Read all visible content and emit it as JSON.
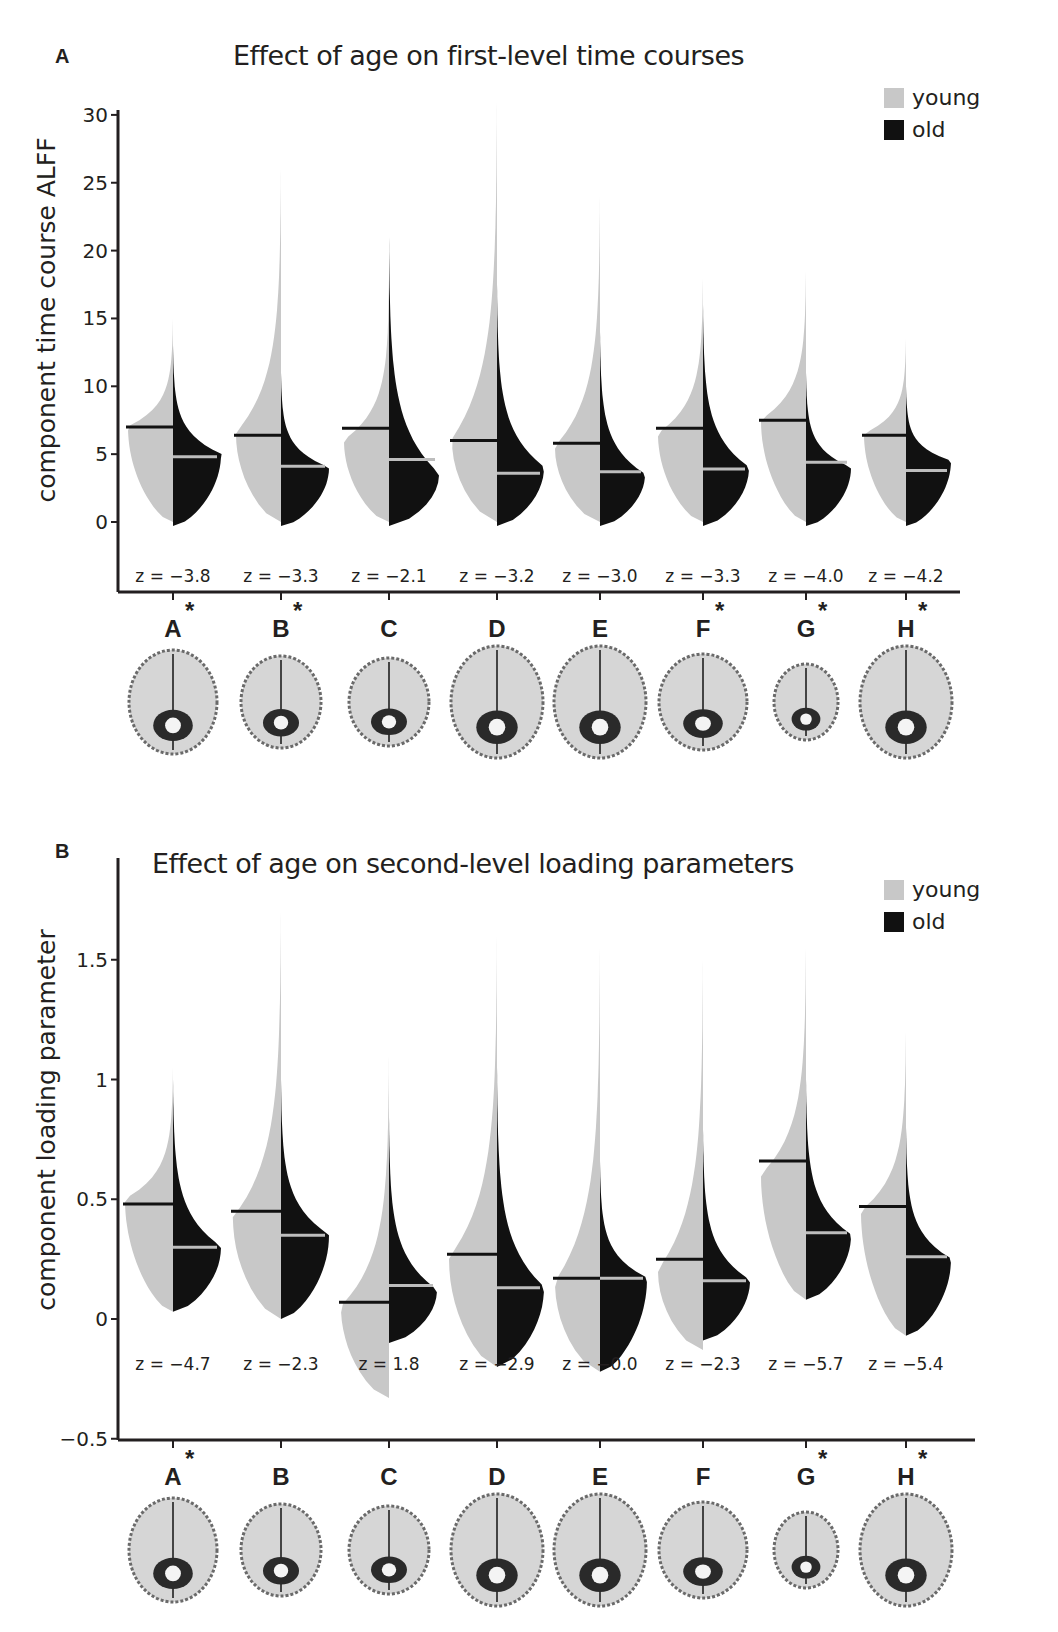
{
  "panels": {
    "A": {
      "letter": "A",
      "title": "Effect of age on first-level time courses",
      "ylabel": "component time course  ALFF",
      "legend": [
        {
          "label": "young",
          "color": "#c8c8c8"
        },
        {
          "label": "old",
          "color": "#111111"
        }
      ]
    },
    "B": {
      "letter": "B",
      "title": "Effect of age on second-level loading parameters",
      "ylabel": "component loading parameter",
      "legend": [
        {
          "label": "young",
          "color": "#c8c8c8"
        },
        {
          "label": "old",
          "color": "#111111"
        }
      ]
    }
  },
  "chart_data": [
    {
      "type": "split-violin",
      "title": "Effect of age on first-level time courses",
      "xlabel": "",
      "ylabel": "component time course  ALFF",
      "ylim": [
        -5,
        30
      ],
      "yticks": [
        0,
        5,
        10,
        15,
        20,
        25,
        30
      ],
      "grid": false,
      "legend_position": "top-right",
      "categories": [
        "A*",
        "B*",
        "C",
        "D",
        "E",
        "F*",
        "G*",
        "H*"
      ],
      "significant": [
        true,
        true,
        false,
        false,
        false,
        true,
        true,
        true
      ],
      "z_labels": [
        "z = −3.8",
        "z = −3.3",
        "z = −2.1",
        "z = −3.2",
        "z = −3.0",
        "z = −3.3",
        "z = −4.0",
        "z = −4.2"
      ],
      "z_values": [
        -3.8,
        -3.3,
        -2.1,
        -3.2,
        -3.0,
        -3.3,
        -4.0,
        -4.2
      ],
      "series": [
        {
          "name": "young",
          "color": "#c8c8c8",
          "medians": [
            7.0,
            6.4,
            6.9,
            6.0,
            5.8,
            6.9,
            7.5,
            6.4
          ],
          "min": [
            0.0,
            0.0,
            0.0,
            0.0,
            0.0,
            0.0,
            0.0,
            0.0
          ],
          "max": [
            15,
            26,
            18,
            31,
            24,
            18,
            18.5,
            13.5
          ],
          "peak": [
            7.0,
            6.5,
            6.0,
            6.0,
            5.5,
            6.5,
            7.5,
            6.5
          ],
          "width": [
            45,
            45,
            45,
            45,
            45,
            45,
            45,
            42
          ]
        },
        {
          "name": "old",
          "color": "#111111",
          "medians": [
            4.8,
            4.1,
            4.6,
            3.6,
            3.7,
            3.9,
            4.4,
            3.8
          ],
          "min": [
            -0.3,
            -0.3,
            -0.3,
            -0.3,
            -0.3,
            -0.3,
            -0.3,
            -0.3
          ],
          "max": [
            13,
            11,
            21,
            17.5,
            14,
            16,
            11,
            10
          ],
          "peak": [
            5.0,
            4.0,
            3.5,
            4.0,
            3.5,
            4.0,
            4.0,
            4.5
          ],
          "width": [
            48,
            48,
            50,
            47,
            45,
            46,
            45,
            45
          ]
        }
      ]
    },
    {
      "type": "split-violin",
      "title": "Effect of age on second-level loading parameters",
      "xlabel": "",
      "ylabel": "component loading parameter",
      "ylim": [
        -0.5,
        1.75
      ],
      "yticks": [
        -0.5,
        0,
        0.5,
        1,
        1.5
      ],
      "grid": false,
      "legend_position": "top-right",
      "categories": [
        "A*",
        "B",
        "C",
        "D",
        "E",
        "F",
        "G*",
        "H*"
      ],
      "significant": [
        true,
        false,
        false,
        false,
        false,
        false,
        true,
        true
      ],
      "z_labels": [
        "z = −4.7",
        "z = −2.3",
        "z = 1.8",
        "z = −2.9",
        "z = −0.0",
        "z = −2.3",
        "z = −5.7",
        "z = −5.4"
      ],
      "z_values": [
        -4.7,
        -2.3,
        1.8,
        -2.9,
        -0.0,
        -2.3,
        -5.7,
        -5.4
      ],
      "series": [
        {
          "name": "young",
          "color": "#c8c8c8",
          "medians": [
            0.48,
            0.45,
            0.07,
            0.27,
            0.17,
            0.25,
            0.66,
            0.47
          ],
          "min": [
            0.03,
            0.0,
            -0.33,
            -0.2,
            -0.22,
            -0.13,
            0.08,
            -0.07
          ],
          "max": [
            1.05,
            1.7,
            1.1,
            1.6,
            1.55,
            1.5,
            1.55,
            1.2
          ],
          "peak": [
            0.5,
            0.42,
            0.05,
            0.25,
            0.15,
            0.2,
            0.6,
            0.45
          ],
          "width": [
            48,
            48,
            48,
            48,
            45,
            45,
            45,
            45
          ]
        },
        {
          "name": "old",
          "color": "#111111",
          "medians": [
            0.3,
            0.35,
            0.14,
            0.13,
            0.17,
            0.16,
            0.36,
            0.26
          ],
          "min": [
            0.03,
            0.0,
            -0.1,
            -0.2,
            -0.22,
            -0.09,
            0.08,
            -0.07
          ],
          "max": [
            1.0,
            1.0,
            0.84,
            1.05,
            0.66,
            0.79,
            1.0,
            0.8
          ],
          "peak": [
            0.3,
            0.35,
            0.12,
            0.13,
            0.17,
            0.16,
            0.35,
            0.25
          ],
          "width": [
            48,
            48,
            48,
            47,
            47,
            47,
            45,
            45
          ]
        }
      ]
    }
  ]
}
